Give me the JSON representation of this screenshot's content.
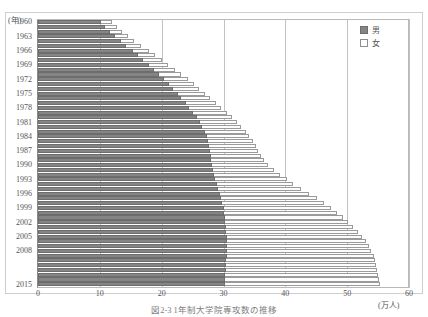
{
  "chart_data": {
    "type": "bar",
    "orientation": "horizontal",
    "stacked": true,
    "title": "",
    "caption": "図2-3 1年制大学院専攻数の推移",
    "xlabel": "(万人)",
    "ylabel": "(年)",
    "xlim": [
      0,
      60
    ],
    "xticks": [
      0,
      10,
      20,
      30,
      40,
      50,
      60
    ],
    "ytick_labels": [
      "1960",
      "1963",
      "1966",
      "1969",
      "1972",
      "1975",
      "1978",
      "1981",
      "1984",
      "1987",
      "1990",
      "1993",
      "1996",
      "1999",
      "2002",
      "2005",
      "2008",
      "2015"
    ],
    "grid": "vertical",
    "legend_position": "top-right",
    "legend": [
      {
        "name": "男",
        "color": "#858585"
      },
      {
        "name": "女",
        "color": "#ffffff"
      }
    ],
    "series": [
      {
        "name": "男",
        "color": "#858585"
      },
      {
        "name": "女",
        "color": "#ffffff"
      }
    ],
    "categories": [
      "1960",
      "1961",
      "1962",
      "1963",
      "1964",
      "1965",
      "1966",
      "1967",
      "1968",
      "1969",
      "1970",
      "1971",
      "1972",
      "1973",
      "1974",
      "1975",
      "1976",
      "1977",
      "1978",
      "1979",
      "1980",
      "1981",
      "1982",
      "1983",
      "1984",
      "1985",
      "1986",
      "1987",
      "1988",
      "1989",
      "1990",
      "1991",
      "1992",
      "1993",
      "1994",
      "1995",
      "1996",
      "1997",
      "1998",
      "1999",
      "2000",
      "2001",
      "2002",
      "2003",
      "2004",
      "2005",
      "2006",
      "2007",
      "2008",
      "2009",
      "2010",
      "2011",
      "2012",
      "2013",
      "2014",
      "2015"
    ],
    "rows": [
      {
        "year": "1960",
        "male": 10.2,
        "female": 1.8,
        "total": 12.0
      },
      {
        "year": "1961",
        "male": 10.8,
        "female": 1.9,
        "total": 12.7
      },
      {
        "year": "1962",
        "male": 11.6,
        "female": 2.0,
        "total": 13.6
      },
      {
        "year": "1963",
        "male": 12.5,
        "female": 2.1,
        "total": 14.6
      },
      {
        "year": "1964",
        "male": 13.4,
        "female": 2.2,
        "total": 15.6
      },
      {
        "year": "1965",
        "male": 14.3,
        "female": 2.4,
        "total": 16.7
      },
      {
        "year": "1966",
        "male": 15.3,
        "female": 2.6,
        "total": 17.9
      },
      {
        "year": "1967",
        "male": 16.2,
        "female": 2.8,
        "total": 19.0
      },
      {
        "year": "1968",
        "male": 17.0,
        "female": 3.0,
        "total": 20.0
      },
      {
        "year": "1969",
        "male": 17.9,
        "female": 3.2,
        "total": 21.1
      },
      {
        "year": "1970",
        "male": 18.8,
        "female": 3.4,
        "total": 22.2
      },
      {
        "year": "1971",
        "male": 19.6,
        "female": 3.6,
        "total": 23.2
      },
      {
        "year": "1972",
        "male": 20.4,
        "female": 3.8,
        "total": 24.2
      },
      {
        "year": "1973",
        "male": 21.2,
        "female": 4.0,
        "total": 25.2
      },
      {
        "year": "1974",
        "male": 21.9,
        "female": 4.2,
        "total": 26.1
      },
      {
        "year": "1975",
        "male": 22.6,
        "female": 4.4,
        "total": 27.0
      },
      {
        "year": "1976",
        "male": 23.2,
        "female": 4.6,
        "total": 27.8
      },
      {
        "year": "1977",
        "male": 23.9,
        "female": 4.9,
        "total": 28.8
      },
      {
        "year": "1978",
        "male": 24.5,
        "female": 5.1,
        "total": 29.6
      },
      {
        "year": "1979",
        "male": 25.1,
        "female": 5.4,
        "total": 30.5
      },
      {
        "year": "1980",
        "male": 25.7,
        "female": 5.7,
        "total": 31.4
      },
      {
        "year": "1981",
        "male": 26.2,
        "female": 6.0,
        "total": 32.2
      },
      {
        "year": "1982",
        "male": 26.6,
        "female": 6.3,
        "total": 32.9
      },
      {
        "year": "1983",
        "male": 27.0,
        "female": 6.6,
        "total": 33.6
      },
      {
        "year": "1984",
        "male": 27.3,
        "female": 6.9,
        "total": 34.2
      },
      {
        "year": "1985",
        "male": 27.5,
        "female": 7.2,
        "total": 34.7
      },
      {
        "year": "1986",
        "male": 27.7,
        "female": 7.5,
        "total": 35.2
      },
      {
        "year": "1987",
        "male": 27.8,
        "female": 7.8,
        "total": 35.6
      },
      {
        "year": "1988",
        "male": 27.9,
        "female": 8.2,
        "total": 36.1
      },
      {
        "year": "1989",
        "male": 28.0,
        "female": 8.6,
        "total": 36.6
      },
      {
        "year": "1990",
        "male": 28.1,
        "female": 9.1,
        "total": 37.2
      },
      {
        "year": "1991",
        "male": 28.3,
        "female": 9.8,
        "total": 38.1
      },
      {
        "year": "1992",
        "male": 28.5,
        "female": 10.6,
        "total": 39.1
      },
      {
        "year": "1993",
        "male": 28.7,
        "female": 11.5,
        "total": 40.2
      },
      {
        "year": "1994",
        "male": 28.9,
        "female": 12.4,
        "total": 41.3
      },
      {
        "year": "1995",
        "male": 29.1,
        "female": 13.4,
        "total": 42.5
      },
      {
        "year": "1996",
        "male": 29.4,
        "female": 14.5,
        "total": 43.9
      },
      {
        "year": "1997",
        "male": 29.6,
        "female": 15.5,
        "total": 45.1
      },
      {
        "year": "1998",
        "male": 29.8,
        "female": 16.5,
        "total": 46.3
      },
      {
        "year": "1999",
        "male": 30.0,
        "female": 17.4,
        "total": 47.4
      },
      {
        "year": "2000",
        "male": 30.1,
        "female": 18.3,
        "total": 48.4
      },
      {
        "year": "2001",
        "male": 30.2,
        "female": 19.1,
        "total": 49.3
      },
      {
        "year": "2002",
        "male": 30.3,
        "female": 19.9,
        "total": 50.2
      },
      {
        "year": "2003",
        "male": 30.4,
        "female": 20.6,
        "total": 51.0
      },
      {
        "year": "2004",
        "male": 30.4,
        "female": 21.3,
        "total": 51.7
      },
      {
        "year": "2005",
        "male": 30.5,
        "female": 21.9,
        "total": 52.4
      },
      {
        "year": "2006",
        "male": 30.5,
        "female": 22.5,
        "total": 53.0
      },
      {
        "year": "2007",
        "male": 30.5,
        "female": 23.0,
        "total": 53.5
      },
      {
        "year": "2008",
        "male": 30.5,
        "female": 23.4,
        "total": 53.9
      },
      {
        "year": "2009",
        "male": 30.5,
        "female": 23.8,
        "total": 54.3
      },
      {
        "year": "2010",
        "male": 30.4,
        "female": 24.1,
        "total": 54.5
      },
      {
        "year": "2011",
        "male": 30.4,
        "female": 24.3,
        "total": 54.7
      },
      {
        "year": "2012",
        "male": 30.4,
        "female": 24.5,
        "total": 54.9
      },
      {
        "year": "2013",
        "male": 30.3,
        "female": 24.7,
        "total": 55.0
      },
      {
        "year": "2014",
        "male": 30.3,
        "female": 24.9,
        "total": 55.2
      },
      {
        "year": "2015",
        "male": 30.2,
        "female": 25.1,
        "total": 55.3
      }
    ]
  },
  "axis": {
    "y_unit": "(年)",
    "x_unit": "(万人)"
  }
}
